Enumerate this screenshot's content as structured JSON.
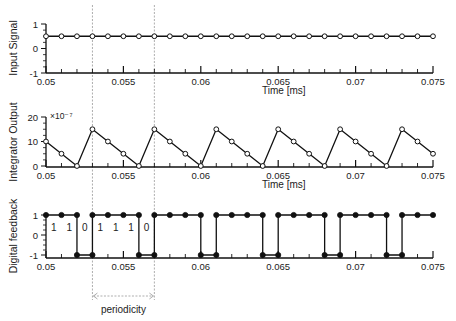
{
  "figure": {
    "xlabel": "Time [ms]",
    "annotation": {
      "label": "periodicity",
      "x_start": 0.053,
      "x_end": 0.057
    },
    "dashed_lines_x": [
      0.053,
      0.057
    ],
    "bit_labels": [
      {
        "x": 0.0505,
        "text": "1"
      },
      {
        "x": 0.0515,
        "text": "1"
      },
      {
        "x": 0.0525,
        "text": "0"
      },
      {
        "x": 0.0535,
        "text": "1"
      },
      {
        "x": 0.0545,
        "text": "1"
      },
      {
        "x": 0.0555,
        "text": "1"
      },
      {
        "x": 0.0565,
        "text": "0"
      }
    ]
  },
  "chart_data": [
    {
      "type": "line",
      "title": "",
      "xlabel": "Time [ms]",
      "ylabel": "Input Signal",
      "xlim": [
        0.05,
        0.075
      ],
      "ylim": [
        -1,
        1
      ],
      "x_ticks": [
        0.05,
        0.055,
        0.06,
        0.065,
        0.07,
        0.075
      ],
      "x_tick_labels": [
        "0.05",
        "0.055",
        "0.06",
        "0.065",
        "0.07",
        "0.075"
      ],
      "y_ticks": [
        1,
        0,
        -1
      ],
      "y_tick_labels": [
        "1",
        "0",
        "-1"
      ],
      "marker": "open-circle",
      "step": false,
      "x": [
        0.05,
        0.051,
        0.052,
        0.053,
        0.054,
        0.055,
        0.056,
        0.057,
        0.058,
        0.059,
        0.06,
        0.061,
        0.062,
        0.063,
        0.064,
        0.065,
        0.066,
        0.067,
        0.068,
        0.069,
        0.07,
        0.071,
        0.072,
        0.073,
        0.074,
        0.075
      ],
      "values": [
        0.5,
        0.5,
        0.5,
        0.5,
        0.5,
        0.5,
        0.5,
        0.5,
        0.5,
        0.5,
        0.5,
        0.5,
        0.5,
        0.5,
        0.5,
        0.5,
        0.5,
        0.5,
        0.5,
        0.5,
        0.5,
        0.5,
        0.5,
        0.5,
        0.5,
        0.5
      ]
    },
    {
      "type": "line",
      "title": "",
      "xlabel": "",
      "ylabel": "Integrator Output",
      "y_scale_label": "×10⁻⁷",
      "xlim": [
        0.05,
        0.075
      ],
      "ylim": [
        0,
        20
      ],
      "x_ticks": [
        0.05,
        0.055,
        0.06,
        0.065,
        0.07,
        0.075
      ],
      "x_tick_labels": [
        "0.05",
        "0.055",
        "0.06",
        "0.065",
        "0.07",
        "0.075"
      ],
      "y_ticks": [
        20,
        10,
        0
      ],
      "y_tick_labels": [
        "20",
        "10",
        "0"
      ],
      "marker": "open-circle",
      "step": false,
      "x": [
        0.05,
        0.051,
        0.052,
        0.053,
        0.054,
        0.055,
        0.056,
        0.057,
        0.058,
        0.059,
        0.06,
        0.061,
        0.062,
        0.063,
        0.064,
        0.065,
        0.066,
        0.067,
        0.068,
        0.069,
        0.07,
        0.071,
        0.072,
        0.073,
        0.074,
        0.075
      ],
      "values": [
        10,
        5,
        0,
        15,
        10,
        5,
        0,
        15,
        10,
        5,
        0,
        15,
        10,
        5,
        0,
        15,
        10,
        5,
        0,
        15,
        10,
        5,
        0,
        15,
        10,
        5
      ]
    },
    {
      "type": "line",
      "title": "",
      "xlabel": "",
      "ylabel": "Digital feedback",
      "xlim": [
        0.05,
        0.075
      ],
      "ylim": [
        -1,
        1
      ],
      "x_ticks": [
        0.05,
        0.055,
        0.06,
        0.065,
        0.07,
        0.075
      ],
      "x_tick_labels": [
        "0.05",
        "0.055",
        "0.06",
        "0.065",
        "0.07",
        "0.075"
      ],
      "y_ticks": [
        1,
        0,
        -1
      ],
      "y_tick_labels": [
        "1",
        "0",
        "-1"
      ],
      "marker": "filled-circle",
      "step": true,
      "x": [
        0.05,
        0.051,
        0.052,
        0.053,
        0.054,
        0.055,
        0.056,
        0.057,
        0.058,
        0.059,
        0.06,
        0.061,
        0.062,
        0.063,
        0.064,
        0.065,
        0.066,
        0.067,
        0.068,
        0.069,
        0.07,
        0.071,
        0.072,
        0.073,
        0.074,
        0.075
      ],
      "values": [
        1,
        1,
        1,
        1,
        1,
        1,
        1,
        1,
        1,
        1,
        1,
        1,
        1,
        1,
        1,
        1,
        1,
        1,
        1,
        1,
        1,
        1,
        1,
        1,
        1,
        1
      ],
      "step_segments": [
        {
          "x0": 0.05,
          "x1": 0.052,
          "y": 1
        },
        {
          "x0": 0.052,
          "x1": 0.053,
          "y": -1
        },
        {
          "x0": 0.053,
          "x1": 0.056,
          "y": 1
        },
        {
          "x0": 0.056,
          "x1": 0.057,
          "y": -1
        },
        {
          "x0": 0.057,
          "x1": 0.06,
          "y": 1
        },
        {
          "x0": 0.06,
          "x1": 0.061,
          "y": -1
        },
        {
          "x0": 0.061,
          "x1": 0.064,
          "y": 1
        },
        {
          "x0": 0.064,
          "x1": 0.065,
          "y": -1
        },
        {
          "x0": 0.065,
          "x1": 0.068,
          "y": 1
        },
        {
          "x0": 0.068,
          "x1": 0.069,
          "y": -1
        },
        {
          "x0": 0.069,
          "x1": 0.072,
          "y": 1
        },
        {
          "x0": 0.072,
          "x1": 0.073,
          "y": -1
        },
        {
          "x0": 0.073,
          "x1": 0.075,
          "y": 1
        }
      ],
      "points": [
        [
          0.05,
          1
        ],
        [
          0.051,
          1
        ],
        [
          0.052,
          1
        ],
        [
          0.052,
          -1
        ],
        [
          0.053,
          -1
        ],
        [
          0.053,
          1
        ],
        [
          0.054,
          1
        ],
        [
          0.055,
          1
        ],
        [
          0.056,
          1
        ],
        [
          0.056,
          -1
        ],
        [
          0.057,
          -1
        ],
        [
          0.057,
          1
        ],
        [
          0.058,
          1
        ],
        [
          0.059,
          1
        ],
        [
          0.06,
          1
        ],
        [
          0.06,
          -1
        ],
        [
          0.061,
          -1
        ],
        [
          0.061,
          1
        ],
        [
          0.062,
          1
        ],
        [
          0.063,
          1
        ],
        [
          0.064,
          1
        ],
        [
          0.064,
          -1
        ],
        [
          0.065,
          -1
        ],
        [
          0.065,
          1
        ],
        [
          0.066,
          1
        ],
        [
          0.067,
          1
        ],
        [
          0.068,
          1
        ],
        [
          0.068,
          -1
        ],
        [
          0.069,
          -1
        ],
        [
          0.069,
          1
        ],
        [
          0.07,
          1
        ],
        [
          0.071,
          1
        ],
        [
          0.072,
          1
        ],
        [
          0.072,
          -1
        ],
        [
          0.073,
          -1
        ],
        [
          0.073,
          1
        ],
        [
          0.074,
          1
        ],
        [
          0.075,
          1
        ]
      ]
    }
  ]
}
